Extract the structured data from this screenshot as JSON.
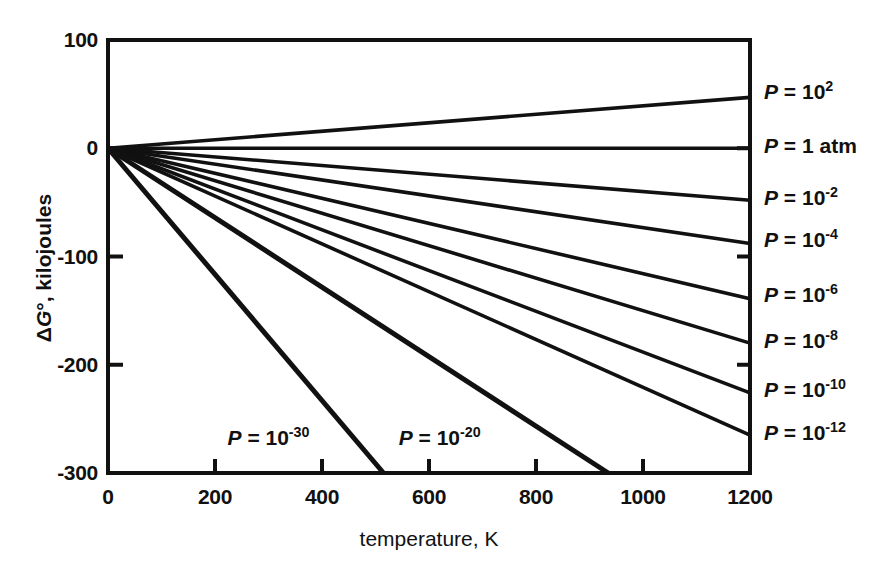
{
  "chart_data": {
    "type": "line",
    "title": "",
    "xlabel": "temperature, K",
    "ylabel": "ΔG°, kilojoules",
    "xlim": [
      0,
      1200
    ],
    "ylim": [
      -300,
      100
    ],
    "xticks": [
      0,
      200,
      400,
      600,
      800,
      1000,
      1200
    ],
    "yticks": [
      100,
      0,
      -100,
      -200,
      -300
    ],
    "xtick_labels": [
      "0",
      "200",
      "400",
      "600",
      "800",
      "1000",
      "1200"
    ],
    "ytick_labels": [
      "100",
      "0",
      "-100",
      "-200",
      "-300"
    ],
    "grid": false,
    "legend_position": "right-outside",
    "line_color": "#111111",
    "background_color": "#ffffff",
    "axis_color": "#111111",
    "x": [
      0,
      1200
    ],
    "series": [
      {
        "name": "P = 10^2",
        "label_base": "P = 10",
        "label_exp": "2",
        "label_plain": "P = 10²",
        "exponent": 2,
        "x": [
          0,
          1200
        ],
        "values": [
          0,
          47
        ],
        "slope_kj_per_k": 0.0392,
        "label_y_kj": 52,
        "placement": "right"
      },
      {
        "name": "P = 1 atm",
        "label_base": "P = 1 atm",
        "label_exp": "",
        "label_plain": "P = 1 atm",
        "exponent": 0,
        "x": [
          0,
          1200
        ],
        "values": [
          0,
          0
        ],
        "slope_kj_per_k": 0.0,
        "label_y_kj": 2,
        "placement": "right"
      },
      {
        "name": "P = 10^-2",
        "label_base": "P = 10",
        "label_exp": "-2",
        "label_plain": "P = 10⁻²",
        "exponent": -2,
        "x": [
          0,
          1200
        ],
        "values": [
          0,
          -48
        ],
        "slope_kj_per_k": -0.04,
        "label_y_kj": -46,
        "placement": "right"
      },
      {
        "name": "P = 10^-4",
        "label_base": "P = 10",
        "label_exp": "-4",
        "label_plain": "P = 10⁻⁴",
        "exponent": -4,
        "x": [
          0,
          1200
        ],
        "values": [
          0,
          -88
        ],
        "slope_kj_per_k": -0.0733,
        "label_y_kj": -85,
        "placement": "right"
      },
      {
        "name": "P = 10^-6",
        "label_base": "P = 10",
        "label_exp": "-6",
        "label_plain": "P = 10⁻⁶",
        "exponent": -6,
        "x": [
          0,
          1200
        ],
        "values": [
          0,
          -139
        ],
        "slope_kj_per_k": -0.1158,
        "label_y_kj": -136,
        "placement": "right"
      },
      {
        "name": "P = 10^-8",
        "label_base": "P = 10",
        "label_exp": "-8",
        "label_plain": "P = 10⁻⁸",
        "exponent": -8,
        "x": [
          0,
          1200
        ],
        "values": [
          0,
          -180
        ],
        "slope_kj_per_k": -0.15,
        "label_y_kj": -178,
        "placement": "right"
      },
      {
        "name": "P = 10^-10",
        "label_base": "P = 10",
        "label_exp": "-10",
        "label_plain": "P = 10⁻¹⁰",
        "exponent": -10,
        "x": [
          0,
          1200
        ],
        "values": [
          0,
          -226
        ],
        "slope_kj_per_k": -0.1883,
        "label_y_kj": -223,
        "placement": "right"
      },
      {
        "name": "P = 10^-12",
        "label_base": "P = 10",
        "label_exp": "-12",
        "label_plain": "P = 10⁻¹²",
        "exponent": -12,
        "x": [
          0,
          1200
        ],
        "values": [
          0,
          -265
        ],
        "slope_kj_per_k": -0.2208,
        "label_y_kj": -263,
        "placement": "right"
      },
      {
        "name": "P = 10^-20",
        "label_base": "P = 10",
        "label_exp": "-20",
        "label_plain": "P = 10⁻²⁰",
        "exponent": -20,
        "x": [
          0,
          935
        ],
        "values": [
          0,
          -300
        ],
        "slope_kj_per_k": -0.3209,
        "label_x_k": 620,
        "label_y_kj": -268,
        "placement": "inplot"
      },
      {
        "name": "P = 10^-30",
        "label_base": "P = 10",
        "label_exp": "-30",
        "label_plain": "P = 10⁻³⁰",
        "exponent": -30,
        "x": [
          0,
          515
        ],
        "values": [
          0,
          -300
        ],
        "slope_kj_per_k": -0.5825,
        "label_x_k": 300,
        "label_y_kj": -268,
        "placement": "inplot"
      }
    ]
  }
}
